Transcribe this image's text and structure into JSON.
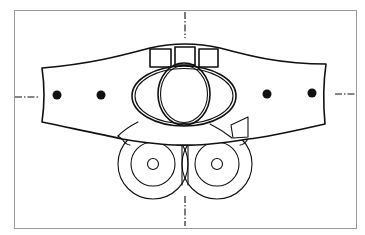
{
  "figure": {
    "type": "technical line drawing",
    "frame": {
      "x": 14,
      "y": 10,
      "width": 342,
      "height": 218,
      "color": "#9a9a9a"
    },
    "colors": {
      "ink": "#111111",
      "background": "#ffffff",
      "frame": "#9a9a9a"
    },
    "components": {
      "center_lines": [
        "vertical-center-line",
        "horizontal-center-line"
      ],
      "body": "curved band",
      "top_windows": 3,
      "central_oval_lobes": 3,
      "mounting_holes": 4,
      "rollers": 2,
      "side_tab": 1
    },
    "text": []
  }
}
